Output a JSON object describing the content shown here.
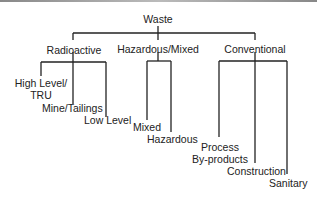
{
  "diagram": {
    "root": "Waste",
    "categories": [
      {
        "label": "Radioactive",
        "children": [
          "High Level/ TRU",
          "Mine/Tailings",
          "Low Level"
        ]
      },
      {
        "label": "Hazardous/Mixed",
        "children": [
          "Mixed",
          "Hazardous"
        ]
      },
      {
        "label": "Conventional",
        "children": [
          "Process By-products",
          "Construction",
          "Sanitary"
        ]
      }
    ]
  },
  "labels": {
    "root": "Waste",
    "radioactive": "Radioactive",
    "hazardous_mixed": "Hazardous/Mixed",
    "conventional": "Conventional",
    "high_level_1": "High Level/",
    "high_level_2": "TRU",
    "mine_tailings": "Mine/Tailings",
    "low_level": "Low Level",
    "mixed": "Mixed",
    "hazardous": "Hazardous",
    "process_1": "Process",
    "process_2": "By-products",
    "construction": "Construction",
    "sanitary": "Sanitary"
  }
}
